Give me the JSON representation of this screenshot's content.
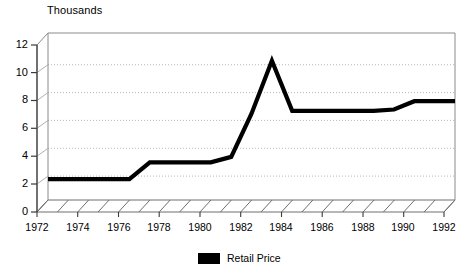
{
  "chart_data": {
    "type": "line",
    "title": "",
    "unit_label": "Thousands",
    "xlabel": "",
    "ylabel": "Thousands",
    "ylim": [
      0,
      12
    ],
    "yticks": [
      0,
      2,
      4,
      6,
      8,
      10,
      12
    ],
    "xlim": [
      1972,
      1992
    ],
    "xticks": [
      1972,
      1974,
      1976,
      1978,
      1980,
      1982,
      1984,
      1986,
      1988,
      1990,
      1992
    ],
    "xtick_labels": [
      "1972",
      "1974",
      "1976",
      "1978",
      "1980",
      "1982",
      "1984",
      "1986",
      "1988",
      "1990",
      "1992"
    ],
    "ytick_labels": [
      "0",
      "2",
      "4",
      "6",
      "8",
      "10",
      "12"
    ],
    "grid": true,
    "grid_style": "dotted-horizontal-on-back-wall",
    "three_d": true,
    "legend_position": "bottom-center",
    "legend": [
      "Retail Price"
    ],
    "series": [
      {
        "name": "Retail Price",
        "color": "#000000",
        "x": [
          1972,
          1973,
          1974,
          1975,
          1976,
          1977,
          1978,
          1979,
          1980,
          1981,
          1982,
          1983,
          1984,
          1985,
          1986,
          1987,
          1988,
          1989,
          1990,
          1991,
          1992
        ],
        "values": [
          1.5,
          1.5,
          1.5,
          1.5,
          1.5,
          2.7,
          2.7,
          2.7,
          2.7,
          3.1,
          6.2,
          10.0,
          6.4,
          6.4,
          6.4,
          6.4,
          6.4,
          6.5,
          7.1,
          7.1,
          7.1
        ]
      }
    ]
  },
  "legend": {
    "entries": [
      {
        "label": "Retail Price",
        "color": "#000000",
        "swatch": "filled-rect"
      }
    ]
  },
  "axes": {
    "unit_label": "Thousands"
  }
}
